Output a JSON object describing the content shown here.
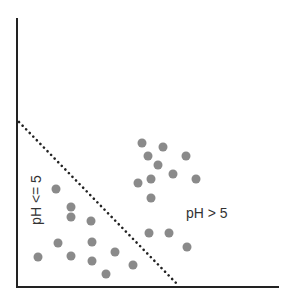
{
  "diagram": {
    "type": "scatter-partition",
    "region_labels": {
      "left": "pH <= 5",
      "right": "pH > 5"
    },
    "axes": {
      "origin": [
        17,
        287
      ],
      "y_top": 19,
      "x_right": 278,
      "color": "#222222",
      "width": 2
    },
    "divider": {
      "style": "dotted",
      "from": [
        19,
        122
      ],
      "to": [
        179,
        286
      ],
      "color": "#222222"
    },
    "point_style": {
      "radius": 4.5,
      "fill": "#8a8a8a"
    },
    "points_right": [
      [
        142,
        143
      ],
      [
        163,
        147
      ],
      [
        148,
        156
      ],
      [
        186,
        156
      ],
      [
        158,
        165
      ],
      [
        173,
        174
      ],
      [
        151,
        179
      ],
      [
        138,
        183
      ],
      [
        196,
        179
      ],
      [
        151,
        198
      ],
      [
        149,
        233
      ],
      [
        169,
        233
      ],
      [
        187,
        247
      ]
    ],
    "points_left": [
      [
        56,
        189
      ],
      [
        71,
        207
      ],
      [
        71,
        217
      ],
      [
        91,
        221
      ],
      [
        58,
        243
      ],
      [
        92,
        242
      ],
      [
        38,
        257
      ],
      [
        71,
        256
      ],
      [
        92,
        261
      ],
      [
        115,
        252
      ],
      [
        106,
        274
      ],
      [
        133,
        265
      ]
    ]
  }
}
